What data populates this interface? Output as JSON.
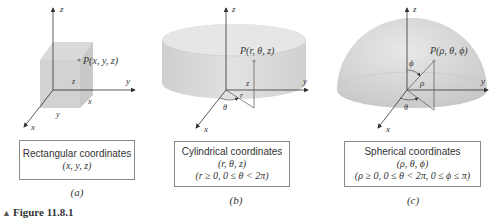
{
  "figure": {
    "caption_marker": "▲",
    "caption": "Figure 11.8.1",
    "panels": [
      {
        "id": "a",
        "sublabel": "(a)",
        "title": "Rectangular coordinates",
        "coords": "(x, y, z)",
        "point_label": "P(x, y, z)",
        "axis_labels": {
          "x": "x",
          "y": "y",
          "z": "z"
        },
        "edge_labels": {
          "x": "x",
          "y": "y",
          "z": "z"
        }
      },
      {
        "id": "b",
        "sublabel": "(b)",
        "title": "Cylindrical coordinates",
        "coords": "(r, θ, z)",
        "constraints": "(r ≥ 0, 0 ≤ θ < 2π)",
        "point_label": "P(r, θ, z)",
        "axis_labels": {
          "x": "x",
          "y": "y",
          "z": "z"
        },
        "edge_labels": {
          "r": "r",
          "theta": "θ",
          "z": "z"
        }
      },
      {
        "id": "c",
        "sublabel": "(c)",
        "title": "Spherical coordinates",
        "coords": "(ρ, θ, ϕ)",
        "constraints": "(ρ ≥ 0, 0 ≤ θ < 2π, 0 ≤ ϕ ≤ π)",
        "point_label": "P(ρ, θ, ϕ)",
        "axis_labels": {
          "x": "x",
          "y": "y",
          "z": "z"
        },
        "edge_labels": {
          "rho": "ρ",
          "theta": "θ",
          "phi": "ϕ"
        }
      }
    ],
    "colors": {
      "solid_fill": "#d6d6d6",
      "solid_dark": "#c4c4c4",
      "axis": "#333333",
      "box_border": "#8a8a8a"
    }
  }
}
